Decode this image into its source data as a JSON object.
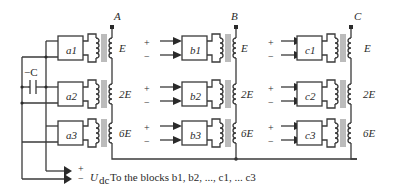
{
  "diagram": {
    "phases": [
      {
        "name": "A",
        "terminal_x": 117
      },
      {
        "name": "B",
        "terminal_x": 236
      },
      {
        "name": "C",
        "terminal_x": 357
      }
    ],
    "blocks": {
      "a": [
        "a1",
        "a2",
        "a3"
      ],
      "b": [
        "b1",
        "b2",
        "b3"
      ],
      "c": [
        "c1",
        "c2",
        "c3"
      ]
    },
    "winding_labels": [
      "E",
      "2E",
      "6E"
    ],
    "capacitor_label": "−C",
    "input_plus": "+",
    "input_minus": "−",
    "dc_source": {
      "plus": "+",
      "minus": "−",
      "symbol_main": "U",
      "symbol_sub": "dc",
      "caption": "To the blocks b1, b2, ..., c1, ... c3"
    }
  }
}
